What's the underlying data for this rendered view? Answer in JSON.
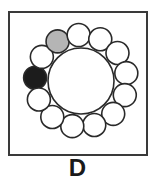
{
  "figure": {
    "label": "D",
    "center": [
      81,
      81
    ],
    "big_circle_radius": 33,
    "ring_radius": 46,
    "small_circle_radius": 11.5,
    "small_circle_count": 13,
    "start_angle_deg": 184,
    "circles": [
      {
        "index": 0,
        "fill": "black"
      },
      {
        "index": 1,
        "fill": "white"
      },
      {
        "index": 2,
        "fill": "gray"
      },
      {
        "index": 3,
        "fill": "white"
      },
      {
        "index": 4,
        "fill": "white"
      },
      {
        "index": 5,
        "fill": "white"
      },
      {
        "index": 6,
        "fill": "white"
      },
      {
        "index": 7,
        "fill": "white"
      },
      {
        "index": 8,
        "fill": "white"
      },
      {
        "index": 9,
        "fill": "white"
      },
      {
        "index": 10,
        "fill": "white"
      },
      {
        "index": 11,
        "fill": "white"
      },
      {
        "index": 12,
        "fill": "white"
      }
    ],
    "colors": {
      "black": "#1c1c1c",
      "gray": "#b5b5b5",
      "white": "#ffffff",
      "stroke": "#2a2a2a",
      "frame": "#3a3a3a"
    }
  }
}
